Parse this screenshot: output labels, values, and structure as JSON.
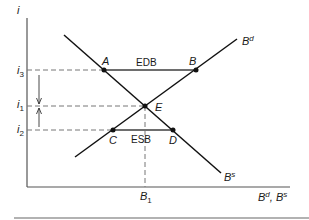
{
  "diagram": {
    "y_axis_label": "i",
    "x_axis_label": {
      "b1": "B",
      "sup1": "d",
      "sep": ", ",
      "b2": "B",
      "sup2": "s"
    },
    "y_ticks": [
      {
        "base": "i",
        "sub": "3",
        "y": 70
      },
      {
        "base": "i",
        "sub": "1",
        "y": 106
      },
      {
        "base": "i",
        "sub": "2",
        "y": 130
      }
    ],
    "x_ticks": [
      {
        "base": "B",
        "sub": "1",
        "x": 145
      }
    ],
    "curves": [
      {
        "name": "B",
        "sup": "d",
        "from": [
          75,
          157
        ],
        "to": [
          237,
          39
        ]
      },
      {
        "name": "B",
        "sup": "s",
        "from": [
          64,
          35
        ],
        "to": [
          221,
          173
        ]
      }
    ],
    "points": [
      {
        "label": "A",
        "x": 104,
        "y": 70
      },
      {
        "label": "B",
        "x": 196,
        "y": 70
      },
      {
        "label": "E",
        "x": 145,
        "y": 106
      },
      {
        "label": "C",
        "x": 113,
        "y": 130
      },
      {
        "label": "D",
        "x": 173,
        "y": 130
      }
    ],
    "gaps": [
      {
        "label": "EDB",
        "from": "A",
        "to": "B"
      },
      {
        "label": "ESB",
        "from": "C",
        "to": "D"
      }
    ],
    "colors": {
      "line": "#111111",
      "gap_line": "#6e6e6e",
      "axis": "#555555",
      "dashed": "#777777"
    }
  }
}
